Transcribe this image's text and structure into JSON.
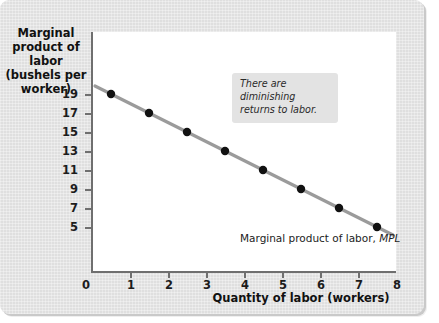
{
  "figure": {
    "background_color": "#e4e4e4",
    "plot_background_color": "#ffffff"
  },
  "chart_data": {
    "type": "line",
    "title": "",
    "xlabel": "Quantity of labor (workers)",
    "ylabel": "Marginal product of labor (bushels per worker)",
    "ylabel_lines": [
      "Marginal",
      "product of labor",
      "(bushels per",
      "worker)"
    ],
    "x": [
      0.5,
      1.5,
      2.5,
      3.5,
      4.5,
      5.5,
      6.5,
      7.5
    ],
    "values": [
      19,
      17,
      15,
      13,
      11,
      9,
      7,
      5
    ],
    "series": [
      {
        "name": "Marginal product of labor, MPL",
        "values": [
          19,
          17,
          15,
          13,
          11,
          9,
          7,
          5
        ],
        "line_color": "#9b9b9b",
        "marker_color": "#111111"
      }
    ],
    "xlim": [
      0,
      8
    ],
    "ylim": [
      4,
      20
    ],
    "xticks": [
      0,
      1,
      2,
      3,
      4,
      5,
      6,
      7,
      8
    ],
    "xtick_labels": [
      "0",
      "1",
      "2",
      "3",
      "4",
      "5",
      "6",
      "7",
      "8"
    ],
    "yticks": [
      19,
      17,
      15,
      13,
      11,
      9,
      7,
      5
    ],
    "ytick_labels": [
      "19",
      "17",
      "15",
      "13",
      "11",
      "9",
      "7",
      "5"
    ],
    "grid": false,
    "legend": "none",
    "annotations": [
      {
        "name": "diminishing-returns-note",
        "text": "There are diminishing returns to labor.",
        "style": "italic-gray-box"
      },
      {
        "name": "curve-label",
        "text_plain": "Marginal product of labor,",
        "text_italic": "MPL"
      }
    ]
  }
}
